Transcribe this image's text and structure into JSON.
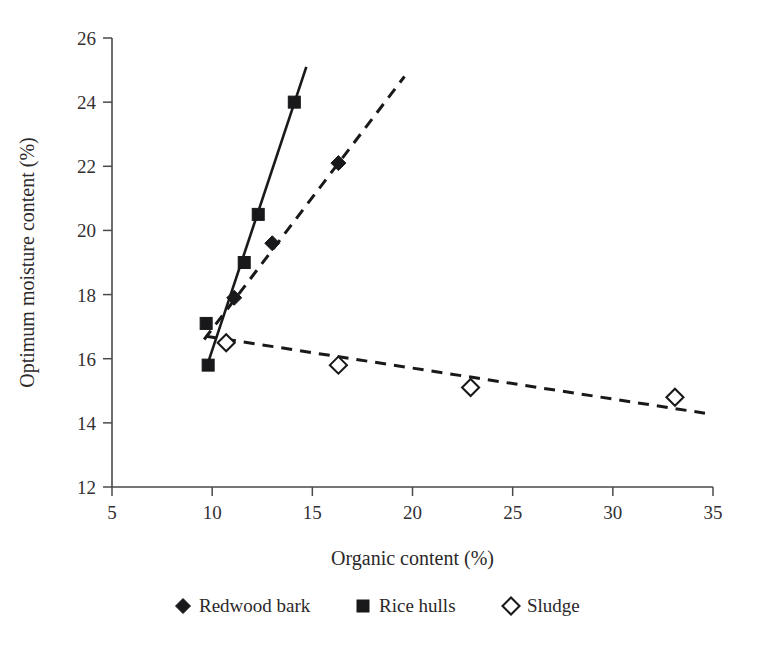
{
  "chart_data": {
    "type": "scatter",
    "title": "",
    "xlabel": "Organic content (%)",
    "ylabel": "Optimum moisture content (%)",
    "xlim": [
      5,
      35
    ],
    "ylim": [
      12,
      26
    ],
    "xticks": [
      "5",
      "10",
      "15",
      "20",
      "25",
      "30",
      "35"
    ],
    "yticks": [
      "12",
      "14",
      "16",
      "18",
      "20",
      "22",
      "24",
      "26"
    ],
    "grid": false,
    "legend_position": "bottom",
    "series": [
      {
        "name": "Redwood bark",
        "marker": "filled-diamond",
        "line_style": "dashed",
        "color": "#19181a",
        "points": [
          {
            "x": 11.1,
            "y": 17.9
          },
          {
            "x": 13.0,
            "y": 19.6
          },
          {
            "x": 16.3,
            "y": 22.1
          }
        ],
        "trend": {
          "x1": 9.6,
          "y1": 16.6,
          "x2": 19.6,
          "y2": 24.8
        }
      },
      {
        "name": "Rice hulls",
        "marker": "filled-square",
        "line_style": "solid",
        "color": "#19181a",
        "points": [
          {
            "x": 9.8,
            "y": 15.8
          },
          {
            "x": 9.7,
            "y": 17.1
          },
          {
            "x": 11.6,
            "y": 19.0
          },
          {
            "x": 12.3,
            "y": 20.5
          },
          {
            "x": 14.1,
            "y": 24.0
          }
        ],
        "trend": {
          "x1": 9.7,
          "y1": 15.7,
          "x2": 14.7,
          "y2": 25.1
        }
      },
      {
        "name": "Sludge",
        "marker": "open-diamond",
        "line_style": "dashed",
        "color": "#19181a",
        "points": [
          {
            "x": 10.7,
            "y": 16.5
          },
          {
            "x": 16.3,
            "y": 15.8
          },
          {
            "x": 22.9,
            "y": 15.1
          },
          {
            "x": 33.1,
            "y": 14.8
          }
        ],
        "trend": {
          "x1": 9.7,
          "y1": 16.7,
          "x2": 34.6,
          "y2": 14.3
        }
      }
    ]
  },
  "legend": {
    "items": [
      {
        "label": "Redwood bark",
        "marker": "filled-diamond"
      },
      {
        "label": "Rice hulls",
        "marker": "filled-square"
      },
      {
        "label": "Sludge",
        "marker": "open-diamond"
      }
    ]
  }
}
